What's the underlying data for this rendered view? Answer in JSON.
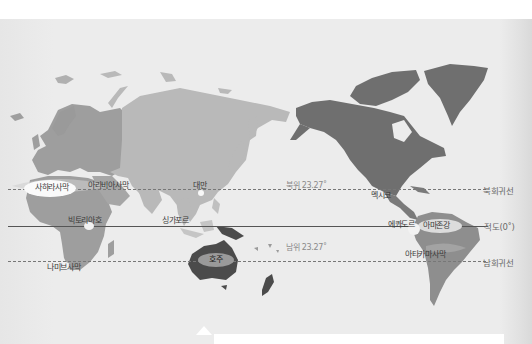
{
  "map": {
    "type": "world-map",
    "projection": "pacific-centered",
    "colors": {
      "background_top": "#ffffff",
      "ocean": "#ececec",
      "europe_africa": "#9e9e9e",
      "asia": "#b9b9b9",
      "north_america": "#6f6f6f",
      "south_america": "#8e8e8e",
      "australia": "#4b4b4b",
      "highlight_zone": "#f4f4f4",
      "line": "#777777"
    },
    "lines": {
      "tropic_of_cancer": {
        "label": "북회귀선",
        "lat_label": "북위 23.27˚",
        "style": "dashed"
      },
      "equator": {
        "label": "적도(0˚)",
        "style": "solid"
      },
      "tropic_of_capricorn": {
        "label": "남회귀선",
        "lat_label": "남위 23.27˚",
        "style": "dashed"
      }
    },
    "places": {
      "sahara": "사하라사막",
      "arabian": "아라비아사막",
      "taiwan": "대만",
      "mexico": "멕시코",
      "victoria": "빅토리아호",
      "singapore": "싱가포르",
      "ecuador": "에콰도르",
      "amazon": "아마존강",
      "namib": "나미브사막",
      "australia": "호주",
      "atacama": "아타카마사막"
    }
  }
}
